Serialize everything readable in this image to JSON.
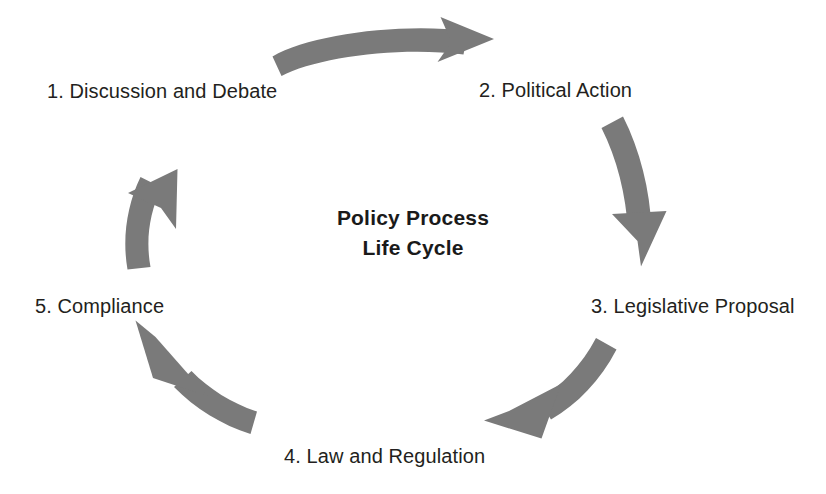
{
  "diagram": {
    "title_lines": [
      "Policy Process",
      "Life Cycle"
    ],
    "title_full": "Policy Process Life Cycle",
    "type": "cycle",
    "direction": "clockwise",
    "colors": {
      "arrow": "#7a7a7a",
      "label_text": "#231f20",
      "title_text": "#1a1a1a",
      "background": "#ffffff"
    },
    "stages": [
      {
        "number": "1.",
        "label": "1. Discussion and Debate"
      },
      {
        "number": "2.",
        "label": "2. Political Action"
      },
      {
        "number": "3.",
        "label": "3. Legislative Proposal"
      },
      {
        "number": "4.",
        "label": "4. Law and Regulation"
      },
      {
        "number": "5.",
        "label": "5. Compliance"
      }
    ],
    "arrows": [
      {
        "name": "arrow-1-to-2",
        "from": "1. Discussion and Debate",
        "to": "2. Political Action"
      },
      {
        "name": "arrow-2-to-3",
        "from": "2. Political Action",
        "to": "3. Legislative Proposal"
      },
      {
        "name": "arrow-3-to-4",
        "from": "3. Legislative Proposal",
        "to": "4. Law and Regulation"
      },
      {
        "name": "arrow-4-to-5",
        "from": "4. Law and Regulation",
        "to": "5. Compliance"
      },
      {
        "name": "arrow-5-to-1",
        "from": "5. Compliance",
        "to": "1. Discussion and Debate"
      }
    ]
  }
}
